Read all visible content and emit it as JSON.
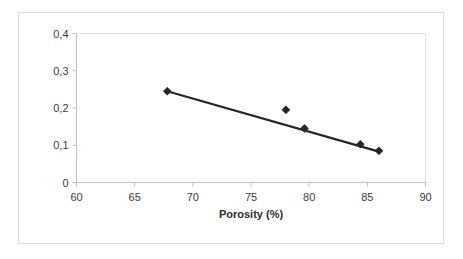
{
  "chart_data": {
    "type": "scatter",
    "title": "",
    "xlabel": "Porosity (%)",
    "ylabel": "Thermal conductivity (W/m/K)",
    "xlim": [
      60,
      90
    ],
    "ylim": [
      0,
      0.4
    ],
    "xticks": [
      60,
      65,
      70,
      75,
      80,
      85,
      90
    ],
    "yticks": [
      0,
      0.1,
      0.2,
      0.3,
      0.4
    ],
    "xtick_labels": [
      "60",
      "65",
      "70",
      "75",
      "80",
      "85",
      "90"
    ],
    "ytick_labels": [
      "0",
      "0,1",
      "0,2",
      "0,3",
      "0,4"
    ],
    "decimal_separator": ",",
    "grid": false,
    "legend": false,
    "marker": "diamond",
    "marker_color": "#262626",
    "line_color": "#262626",
    "axis_color": "#bfbfbf",
    "background_color": "#ffffff",
    "frame_color": "#d9d9d9",
    "points": [
      {
        "x": 67.8,
        "y": 0.245
      },
      {
        "x": 78.0,
        "y": 0.195
      },
      {
        "x": 79.6,
        "y": 0.145
      },
      {
        "x": 84.4,
        "y": 0.103
      },
      {
        "x": 86.0,
        "y": 0.085
      }
    ],
    "series": [
      {
        "name": "Thermal conductivity",
        "x": [
          67.8,
          78.0,
          79.6,
          84.4,
          86.0
        ],
        "values": [
          0.245,
          0.195,
          0.145,
          0.103,
          0.085
        ]
      }
    ],
    "trendline": {
      "type": "linear",
      "x_start": 67.8,
      "y_start": 0.245,
      "x_end": 86.0,
      "y_end": 0.083
    }
  }
}
